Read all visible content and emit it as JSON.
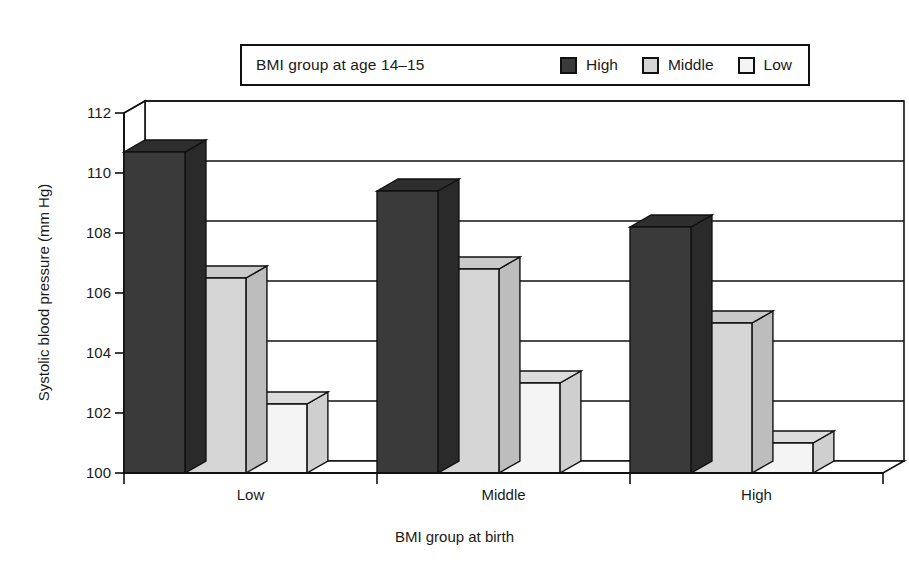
{
  "legend": {
    "title": "BMI group at age 14–15",
    "entries": [
      {
        "label": "High",
        "color": "#3a3a3a"
      },
      {
        "label": "Middle",
        "color": "#d5d5d5"
      },
      {
        "label": "Low",
        "color": "#f4f4f4"
      }
    ]
  },
  "axes": {
    "ylabel": "Systolic blood pressure (mm Hg)",
    "xlabel": "BMI group at birth",
    "yticks": [
      100,
      102,
      104,
      106,
      108,
      110,
      112
    ],
    "xcategories": [
      "Low",
      "Middle",
      "High"
    ]
  },
  "colors": {
    "bar_high_front": "#3a3a3a",
    "bar_high_top": "#2e2e2e",
    "bar_high_side": "#2a2a2a",
    "bar_middle_front": "#d6d6d6",
    "bar_middle_top": "#c9c9c9",
    "bar_middle_side": "#bdbdbd",
    "bar_low_front": "#f4f4f4",
    "bar_low_top": "#dcdcdc",
    "bar_low_side": "#cfcfcf",
    "outline": "#111111",
    "gridline": "#111111",
    "floor": "#cfcfcf"
  },
  "chart_data": {
    "type": "bar",
    "title": "",
    "xlabel": "BMI group at birth",
    "ylabel": "Systolic blood pressure (mm Hg)",
    "categories": [
      "Low",
      "Middle",
      "High"
    ],
    "series": [
      {
        "name": "High",
        "values": [
          110.7,
          109.4,
          108.2
        ]
      },
      {
        "name": "Middle",
        "values": [
          106.5,
          106.8,
          105.0
        ]
      },
      {
        "name": "Low",
        "values": [
          102.3,
          103.0,
          101.0
        ]
      }
    ],
    "legend_title": "BMI group at age 14–15",
    "ylim": [
      100,
      112
    ],
    "ytick_step": 2,
    "grid": true,
    "legend_position": "top",
    "three_d": true
  }
}
